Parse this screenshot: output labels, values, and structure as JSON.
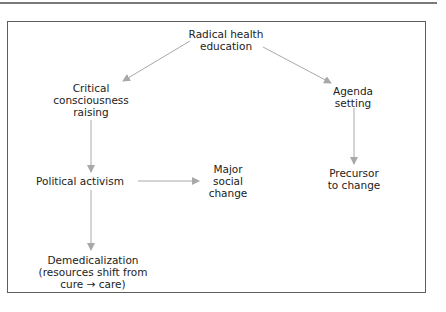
{
  "diagram": {
    "type": "flowchart",
    "colors": {
      "frame": "#5e5e5e",
      "arrow": "#a8a8a8",
      "text": "#222222"
    },
    "nodes": {
      "radical": {
        "lines": [
          "Radical health",
          "education"
        ]
      },
      "critical": {
        "lines": [
          "Critical",
          "consciousness",
          "raising"
        ]
      },
      "agenda": {
        "lines": [
          "Agenda",
          "setting"
        ]
      },
      "political": {
        "lines": [
          "Political activism"
        ]
      },
      "major": {
        "lines": [
          "Major",
          "social",
          "change"
        ]
      },
      "precursor": {
        "lines": [
          "Precursor",
          "to change"
        ]
      },
      "demed": {
        "lines": [
          "Demedicalization",
          "(resources shift from",
          "cure → care)"
        ]
      }
    },
    "edges": [
      {
        "from": "Radical health education",
        "to": "Critical consciousness raising"
      },
      {
        "from": "Radical health education",
        "to": "Agenda setting"
      },
      {
        "from": "Critical consciousness raising",
        "to": "Political activism"
      },
      {
        "from": "Political activism",
        "to": "Major social change"
      },
      {
        "from": "Political activism",
        "to": "Demedicalization (resources shift from cure → care)"
      },
      {
        "from": "Agenda setting",
        "to": "Precursor to change"
      }
    ]
  }
}
